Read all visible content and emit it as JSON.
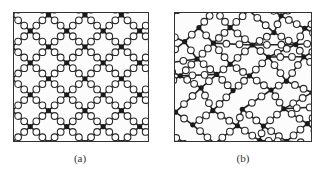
{
  "figure": {
    "panels": [
      {
        "id": "a",
        "label": "(a)",
        "description": "Ordered network lattice: black nodes connected by open-circle bridges",
        "structure": "ordered",
        "node_color": "#1a1a1a",
        "bridge_fill": "#ffffff",
        "bridge_stroke": "#2a2a2a"
      },
      {
        "id": "b",
        "label": "(b)",
        "description": "Disordered network: black nodes connected by open-circle bridges in irregular arrangement",
        "structure": "disordered",
        "node_color": "#1a1a1a",
        "bridge_fill": "#ffffff",
        "bridge_stroke": "#2a2a2a"
      }
    ]
  }
}
